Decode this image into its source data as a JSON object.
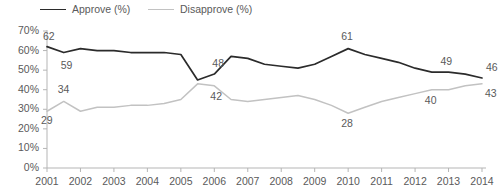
{
  "chart_data": {
    "type": "line",
    "title": "",
    "xlabel": "",
    "ylabel": "",
    "ylim": [
      0,
      70
    ],
    "xlim": [
      2001,
      2014
    ],
    "grid": false,
    "legend_position": "top-left",
    "ytick_labels": [
      "70%",
      "60%",
      "50%",
      "40%",
      "30%",
      "20%",
      "10%",
      "0%"
    ],
    "ytick_values": [
      70,
      60,
      50,
      40,
      30,
      20,
      10,
      0
    ],
    "xtick_labels": [
      "2001",
      "2002",
      "2003",
      "2004",
      "2005",
      "2006",
      "2007",
      "2008",
      "2009",
      "2010",
      "2011",
      "2012",
      "2013",
      "2014"
    ],
    "xtick_values": [
      2001,
      2002,
      2003,
      2004,
      2005,
      2006,
      2007,
      2008,
      2009,
      2010,
      2011,
      2012,
      2013,
      2014
    ],
    "x": [
      2001,
      2001.5,
      2002,
      2002.5,
      2003,
      2003.5,
      2004,
      2004.5,
      2005,
      2005.5,
      2006,
      2006.5,
      2007,
      2007.5,
      2008,
      2008.5,
      2009,
      2009.5,
      2010,
      2010.5,
      2011,
      2011.5,
      2012,
      2012.5,
      2013,
      2013.5,
      2014
    ],
    "series": [
      {
        "name": "Approve (%)",
        "color": "#2b2b2b",
        "values": [
          62,
          59,
          61,
          60,
          60,
          59,
          59,
          59,
          58,
          45,
          48,
          57,
          56,
          53,
          52,
          51,
          53,
          57,
          61,
          58,
          56,
          54,
          51,
          49,
          49,
          48,
          46
        ]
      },
      {
        "name": "Disapprove (%)",
        "color": "#c2c2c2",
        "values": [
          29,
          34,
          29,
          31,
          31,
          32,
          32,
          33,
          35,
          43,
          42,
          35,
          34,
          35,
          36,
          37,
          35,
          32,
          28,
          31,
          34,
          36,
          38,
          40,
          40,
          42,
          43
        ]
      }
    ],
    "annotations": [
      {
        "text": "62",
        "series": "Approve (%)",
        "x": 2001,
        "value": 62
      },
      {
        "text": "59",
        "series": "Approve (%)",
        "x": 2001.5,
        "value": 59
      },
      {
        "text": "48",
        "series": "Approve (%)",
        "x": 2006,
        "value": 48
      },
      {
        "text": "61",
        "series": "Approve (%)",
        "x": 2010,
        "value": 61
      },
      {
        "text": "49",
        "series": "Approve (%)",
        "x": 2013,
        "value": 49
      },
      {
        "text": "46",
        "series": "Approve (%)",
        "x": 2014,
        "value": 46
      },
      {
        "text": "34",
        "series": "Disapprove (%)",
        "x": 2001.5,
        "value": 34
      },
      {
        "text": "29",
        "series": "Disapprove (%)",
        "x": 2001,
        "value": 29
      },
      {
        "text": "42",
        "series": "Disapprove (%)",
        "x": 2006,
        "value": 42
      },
      {
        "text": "28",
        "series": "Disapprove (%)",
        "x": 2010,
        "value": 28
      },
      {
        "text": "40",
        "series": "Disapprove (%)",
        "x": 2012.5,
        "value": 40
      },
      {
        "text": "43",
        "series": "Disapprove (%)",
        "x": 2014,
        "value": 43
      }
    ]
  },
  "legend": {
    "approve_label": "Approve (%)",
    "disapprove_label": "Disapprove (%)"
  },
  "colors": {
    "approve": "#2b2b2b",
    "disapprove": "#c2c2c2",
    "axis": "#b5b5b5",
    "text": "#5a5a5a"
  }
}
